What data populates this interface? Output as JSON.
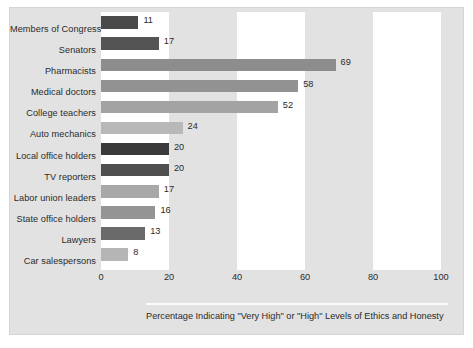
{
  "chart_data": {
    "type": "bar",
    "orientation": "horizontal",
    "title": "",
    "subtitle": "",
    "xlabel": "Percentage Indicating \"Very High\" or \"High\" Levels of Ethics and Honesty",
    "ylabel": "",
    "xlim": [
      0,
      100
    ],
    "xticks": [
      0,
      20,
      40,
      60,
      80,
      100
    ],
    "xtick_labels": [
      "0",
      "20",
      "40",
      "60",
      "80",
      "100"
    ],
    "grid": false,
    "banding": "alternating vertical gray bands every 20 units starting at 20",
    "legend": "none",
    "categories": [
      "Members of Congress",
      "Senators",
      "Pharmacists",
      "Medical doctors",
      "College teachers",
      "Auto mechanics",
      "Local office holders",
      "TV reporters",
      "Labor union leaders",
      "State office holders",
      "Lawyers",
      "Car salespersons"
    ],
    "values": [
      11,
      17,
      69,
      58,
      52,
      24,
      20,
      20,
      17,
      16,
      13,
      8
    ],
    "value_labels": [
      "11",
      "17",
      "69",
      "58",
      "52",
      "24",
      "20",
      "20",
      "17",
      "16",
      "13",
      "8"
    ],
    "bar_colors": [
      "#4a4a4a",
      "#545454",
      "#8d8d8d",
      "#929292",
      "#a3a3a3",
      "#b8b8b8",
      "#3a3a3a",
      "#4f4f4f",
      "#a8a8a8",
      "#949494",
      "#6a6a6a",
      "#b5b5b5"
    ]
  },
  "caption": {
    "text": "Percentage Indicating \"Very High\" or \"High\" Levels of Ethics and Honesty"
  },
  "colors": {
    "figure_background": "#e2e2e2",
    "plot_background": "#ffffff",
    "band": "#e2e2e2",
    "text": "#2b2b2b",
    "divider": "#fafafa"
  }
}
